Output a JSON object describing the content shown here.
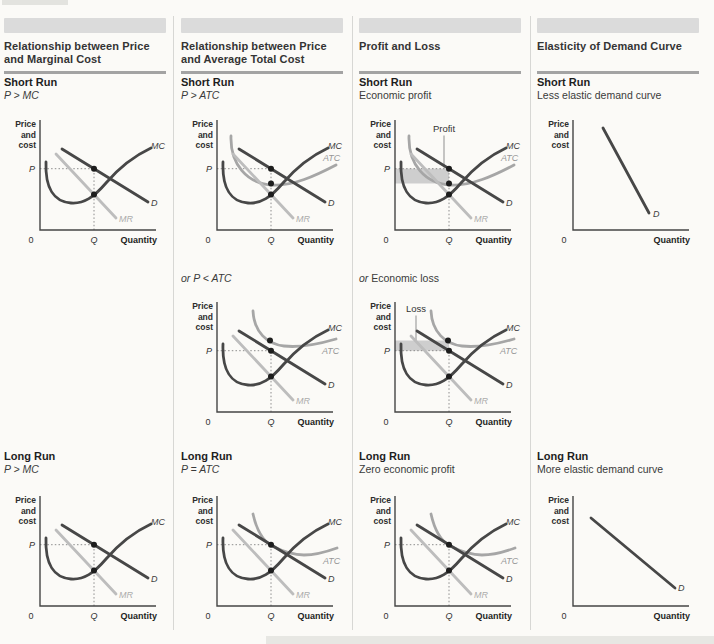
{
  "graph_labels": {
    "price_axis": [
      "Price",
      "and",
      "cost"
    ],
    "quantity": "Quantity",
    "zero": "0",
    "q": "Q",
    "p": "P",
    "mc": "MC",
    "atc": "ATC",
    "d": "D",
    "mr": "MR"
  },
  "annotations": {
    "profit": "Profit",
    "loss": "Loss"
  },
  "colors": {
    "page_bg": "#fbfaf7",
    "header_bar": "#dbdbdb",
    "rule": "#a3a3a3",
    "divider": "#d7d7d4",
    "artifact": "#dededa",
    "axis": "#454545",
    "dark_curve": "#474747",
    "atc_curve": "#a6a6a6",
    "mr_curve": "#bdbdbd",
    "dot": "#1d1d1d",
    "guide": "#808080",
    "shade": "#c9c9c9"
  },
  "columns": [
    {
      "id": "price-marginal-cost",
      "title": "Relationship between Price and Marginal Cost",
      "rows": {
        "short": {
          "heading": "Short Run",
          "note": "P > MC",
          "note_style": "italic",
          "graph": {
            "mc": true,
            "mr": true,
            "d": "normal",
            "atc": null,
            "dots": [
              "p",
              "mcmr"
            ],
            "guides": true,
            "shade": null,
            "pointer": null
          }
        },
        "mid": null,
        "long": {
          "heading": "Long Run",
          "note": "P > MC",
          "note_style": "italic",
          "graph": {
            "mc": true,
            "mr": true,
            "d": "normal",
            "atc": null,
            "dots": [
              "p",
              "mcmr"
            ],
            "guides": true,
            "shade": null,
            "pointer": null
          }
        }
      }
    },
    {
      "id": "price-average-total-cost",
      "title": "Relationship between Price and Average Total Cost",
      "rows": {
        "short": {
          "heading": "Short Run",
          "note": "P > ATC",
          "note_style": "italic",
          "graph": {
            "mc": true,
            "mr": true,
            "d": "normal",
            "atc": "normal",
            "dots": [
              "p",
              "atc",
              "mcmr"
            ],
            "guides": true,
            "shade": null,
            "pointer": null
          }
        },
        "mid": {
          "heading": null,
          "note": "or P < ATC",
          "note_style": "italic",
          "graph": {
            "mc": true,
            "mr": true,
            "d": "normal",
            "atc": "high",
            "dots": [
              "atcTop",
              "p",
              "mcmr"
            ],
            "guides": true,
            "shade": null,
            "pointer": null
          }
        },
        "long": {
          "heading": "Long Run",
          "note": "P = ATC",
          "note_style": "italic",
          "graph": {
            "mc": true,
            "mr": true,
            "d": "normal",
            "atc": "tangent",
            "dots": [
              "p",
              "mcmr"
            ],
            "guides": true,
            "shade": null,
            "pointer": null
          }
        }
      }
    },
    {
      "id": "profit-and-loss",
      "title": "Profit and Loss",
      "rows": {
        "short": {
          "heading": "Short Run",
          "note": "Economic profit",
          "note_style": "normal",
          "graph": {
            "mc": true,
            "mr": true,
            "d": "normal",
            "atc": "normal",
            "dots": [
              "p",
              "atc",
              "mcmr"
            ],
            "guides": true,
            "shade": "profit",
            "pointer": "profit"
          }
        },
        "mid": {
          "heading": null,
          "note": "or Economic loss",
          "note_style": "lead-italic",
          "graph": {
            "mc": true,
            "mr": true,
            "d": "normal",
            "atc": "high",
            "dots": [
              "atcTop",
              "p",
              "mcmr"
            ],
            "guides": true,
            "shade": "loss",
            "pointer": "loss"
          }
        },
        "long": {
          "heading": "Long Run",
          "note": "Zero economic profit",
          "note_style": "normal",
          "graph": {
            "mc": true,
            "mr": true,
            "d": "normal",
            "atc": "tangent",
            "dots": [
              "p",
              "mcmr"
            ],
            "guides": true,
            "shade": null,
            "pointer": null
          }
        }
      }
    },
    {
      "id": "elasticity-of-demand",
      "title": "Elasticity of Demand Curve",
      "rows": {
        "short": {
          "heading": "Short Run",
          "note": "Less elastic demand curve",
          "note_style": "normal",
          "graph": {
            "mc": false,
            "mr": false,
            "d": "steep",
            "atc": null,
            "dots": [],
            "guides": false,
            "shade": null,
            "pointer": null
          }
        },
        "mid": null,
        "long": {
          "heading": "Long Run",
          "note": "More elastic demand curve",
          "note_style": "normal",
          "graph": {
            "mc": false,
            "mr": false,
            "d": "flat",
            "atc": null,
            "dots": [],
            "guides": false,
            "shade": null,
            "pointer": null
          }
        }
      }
    }
  ]
}
